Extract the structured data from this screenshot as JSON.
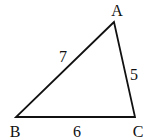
{
  "diagram": {
    "type": "triangle",
    "vertices": {
      "A": {
        "label": "A",
        "x": 114,
        "y": 22
      },
      "B": {
        "label": "B",
        "x": 16,
        "y": 117
      },
      "C": {
        "label": "C",
        "x": 135,
        "y": 117
      }
    },
    "sides": {
      "AB": {
        "label": "7"
      },
      "AC": {
        "label": "5"
      },
      "BC": {
        "label": "6"
      }
    },
    "stroke_color": "#111111"
  }
}
